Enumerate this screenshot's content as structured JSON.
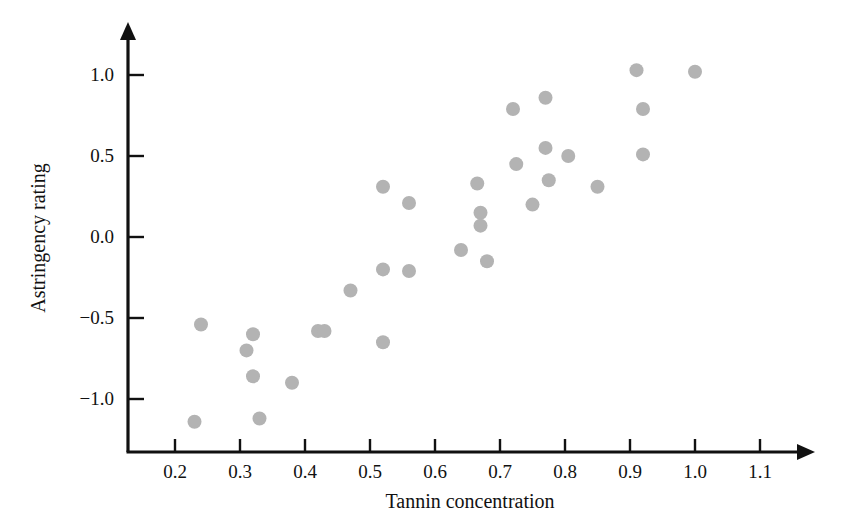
{
  "chart_data": {
    "type": "scatter",
    "title": "",
    "xlabel": "Tannin concentration",
    "ylabel": "Astringency rating",
    "xlim": [
      0.155,
      1.155
    ],
    "ylim": [
      -1.27,
      1.15
    ],
    "grid": false,
    "legend": null,
    "xticks": [
      0.2,
      0.3,
      0.4,
      0.5,
      0.6,
      0.7,
      0.8,
      0.9,
      1.0,
      1.1
    ],
    "xtick_labels": [
      "0.2",
      "0.3",
      "0.4",
      "0.5",
      "0.6",
      "0.7",
      "0.8",
      "0.9",
      "1.0",
      "1.1"
    ],
    "yticks": [
      -1.0,
      -0.5,
      0.0,
      0.5,
      1.0
    ],
    "ytick_labels": [
      "-1.0",
      "-0.5",
      "0.0",
      "0.5",
      "1.0"
    ],
    "marker": {
      "shape": "circle",
      "color": "#b3b3b3",
      "radius_px": 7
    },
    "n_points": 32,
    "points": [
      {
        "x": 0.23,
        "y": -1.14
      },
      {
        "x": 0.24,
        "y": -0.54
      },
      {
        "x": 0.31,
        "y": -0.7
      },
      {
        "x": 0.32,
        "y": -0.6
      },
      {
        "x": 0.32,
        "y": -0.86
      },
      {
        "x": 0.33,
        "y": -1.12
      },
      {
        "x": 0.38,
        "y": -0.9
      },
      {
        "x": 0.42,
        "y": -0.58
      },
      {
        "x": 0.43,
        "y": -0.58
      },
      {
        "x": 0.47,
        "y": -0.33
      },
      {
        "x": 0.52,
        "y": 0.31
      },
      {
        "x": 0.52,
        "y": -0.2
      },
      {
        "x": 0.52,
        "y": -0.65
      },
      {
        "x": 0.56,
        "y": 0.21
      },
      {
        "x": 0.56,
        "y": -0.21
      },
      {
        "x": 0.64,
        "y": -0.08
      },
      {
        "x": 0.665,
        "y": 0.33
      },
      {
        "x": 0.67,
        "y": 0.15
      },
      {
        "x": 0.67,
        "y": 0.07
      },
      {
        "x": 0.68,
        "y": -0.15
      },
      {
        "x": 0.72,
        "y": 0.79
      },
      {
        "x": 0.725,
        "y": 0.45
      },
      {
        "x": 0.75,
        "y": 0.2
      },
      {
        "x": 0.77,
        "y": 0.86
      },
      {
        "x": 0.77,
        "y": 0.55
      },
      {
        "x": 0.775,
        "y": 0.35
      },
      {
        "x": 0.805,
        "y": 0.5
      },
      {
        "x": 0.85,
        "y": 0.31
      },
      {
        "x": 0.91,
        "y": 1.03
      },
      {
        "x": 0.92,
        "y": 0.79
      },
      {
        "x": 0.92,
        "y": 0.51
      },
      {
        "x": 1.0,
        "y": 1.02
      }
    ]
  }
}
